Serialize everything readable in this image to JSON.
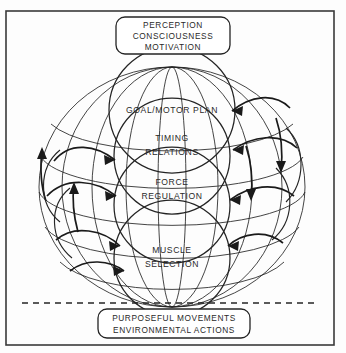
{
  "figure": {
    "type": "diagram",
    "diagram_kind": "hierarchical-motor-control-sphere",
    "top_box": {
      "lines": [
        "PERCEPTION",
        "CONSCIOUSNESS",
        "MOTIVATION"
      ]
    },
    "bottom_box": {
      "lines": [
        "PURPOSEFUL MOVEMENTS",
        "ENVIRONMENTAL ACTIONS"
      ]
    },
    "levels": [
      {
        "id": "goal-motor-plan",
        "lines": [
          "GOAL/MOTOR PLAN"
        ]
      },
      {
        "id": "timing-relations",
        "lines": [
          "TIMING",
          "RELATIONS"
        ]
      },
      {
        "id": "force-regulation",
        "lines": [
          "FORCE",
          "REGULATION"
        ]
      },
      {
        "id": "muscle-selection",
        "lines": [
          "MUSCLE",
          "SELECTION"
        ]
      }
    ],
    "colors": {
      "ink": "#242424",
      "frame": "#3a3a3a",
      "background": "#fdfdfd",
      "text": "#2a2a2a"
    }
  }
}
